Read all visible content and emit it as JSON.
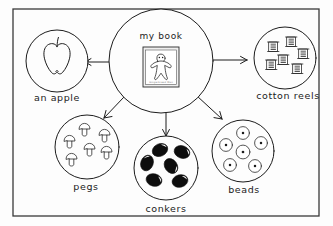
{
  "diagram": {
    "title_node": {
      "label": "my book",
      "icon": "book-cover-gingerbread-man",
      "cover_caption": "Gingerbread Man"
    },
    "branches": [
      {
        "id": "apple",
        "label": "an apple",
        "icon": "apple-icon",
        "item_count": 1,
        "arrow": "arrow-left"
      },
      {
        "id": "cotton-reels",
        "label": "cotton reels",
        "icon": "cotton-reel-icon",
        "item_count": 6,
        "arrow": "arrow-right"
      },
      {
        "id": "pegs",
        "label": "pegs",
        "icon": "peg-icon",
        "item_count": 6,
        "arrow": "arrow-down-left"
      },
      {
        "id": "conkers",
        "label": "conkers",
        "icon": "conker-icon",
        "item_count": 6,
        "arrow": "arrow-down"
      },
      {
        "id": "beads",
        "label": "beads",
        "icon": "bead-icon",
        "item_count": 6,
        "arrow": "arrow-down-right"
      }
    ],
    "colors": {
      "ink": "#1c1c1c",
      "frame": "#3a3a3a",
      "page": "#fdfdfd",
      "conker_fill": "#0d0d0d"
    }
  }
}
